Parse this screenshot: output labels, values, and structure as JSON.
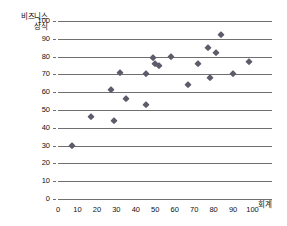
{
  "chart_data": {
    "type": "scatter",
    "title": "",
    "xlabel": "회계",
    "ylabel": "비즈니스 상식",
    "ylabel_lines": [
      "비즈니스",
      "상식"
    ],
    "xlim": [
      0,
      110
    ],
    "ylim": [
      0,
      100
    ],
    "grid": true,
    "legend": false,
    "marker": "diamond",
    "marker_color": "#5c5c6b",
    "gridline_color": "#6f6f6f",
    "xticks": [
      0,
      10,
      20,
      30,
      40,
      50,
      60,
      70,
      80,
      90,
      100
    ],
    "yticks": [
      0,
      10,
      20,
      30,
      40,
      50,
      60,
      70,
      80,
      90,
      100
    ],
    "xtick_labels": [
      "0",
      "10",
      "20",
      "30",
      "40",
      "50",
      "60",
      "70",
      "80",
      "90",
      "100"
    ],
    "ytick_labels": [
      "0",
      "10",
      "20",
      "30",
      "40",
      "50",
      "60",
      "70",
      "80",
      "90",
      "100"
    ],
    "series": [
      {
        "name": "",
        "points": [
          {
            "x": 7,
            "y": 30
          },
          {
            "x": 17,
            "y": 46
          },
          {
            "x": 27,
            "y": 61
          },
          {
            "x": 29,
            "y": 44
          },
          {
            "x": 32,
            "y": 71
          },
          {
            "x": 35,
            "y": 56
          },
          {
            "x": 45,
            "y": 53
          },
          {
            "x": 45,
            "y": 70
          },
          {
            "x": 49,
            "y": 79
          },
          {
            "x": 50,
            "y": 76
          },
          {
            "x": 52,
            "y": 75
          },
          {
            "x": 58,
            "y": 80
          },
          {
            "x": 67,
            "y": 64
          },
          {
            "x": 72,
            "y": 76
          },
          {
            "x": 77,
            "y": 85
          },
          {
            "x": 78,
            "y": 68
          },
          {
            "x": 81,
            "y": 82
          },
          {
            "x": 84,
            "y": 92
          },
          {
            "x": 90,
            "y": 70
          },
          {
            "x": 98,
            "y": 77
          }
        ]
      }
    ]
  }
}
